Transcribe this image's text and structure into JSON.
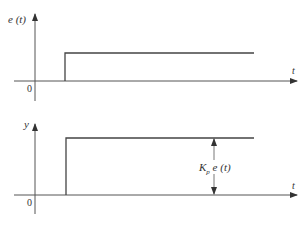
{
  "diagram": {
    "top_plot": {
      "y_label": "e (t)",
      "x_label": "t",
      "origin_label": "0",
      "signal": "step"
    },
    "bottom_plot": {
      "y_label": "y",
      "x_label": "t",
      "origin_label": "0",
      "signal": "step",
      "annotation": "K",
      "annotation_sub": "p",
      "annotation_rest": "e (t)"
    },
    "colors": {
      "line": "#444444",
      "text": "#333333"
    }
  }
}
